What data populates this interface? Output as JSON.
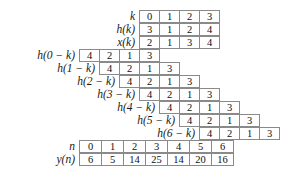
{
  "figure": {
    "cell_width_px": 21,
    "row_height_px": 13,
    "grid_color": "#8a8a8a",
    "background": "#ffffff"
  },
  "chart_data": {
    "type": "table",
    "xlabel": "",
    "ylabel": "",
    "grid": true,
    "legend": "none",
    "index_labels": [
      "k",
      "h(k)",
      "x(k)"
    ],
    "k": [
      0,
      1,
      2,
      3
    ],
    "h_k": [
      3,
      1,
      2,
      4
    ],
    "x_k": [
      2,
      1,
      3,
      4
    ],
    "flipped_label_prefix": "h(",
    "flipped_rows": [
      {
        "label": "h(0 − k)",
        "offset": -3,
        "values": [
          4,
          2,
          1,
          3
        ]
      },
      {
        "label": "h(1 − k)",
        "offset": -2,
        "values": [
          4,
          2,
          1,
          3
        ]
      },
      {
        "label": "h(2 − k)",
        "offset": -1,
        "values": [
          4,
          2,
          1,
          3
        ]
      },
      {
        "label": "h(3 − k)",
        "offset": 0,
        "values": [
          4,
          2,
          1,
          3
        ]
      },
      {
        "label": "h(4 − k)",
        "offset": 1,
        "values": [
          4,
          2,
          1,
          3
        ]
      },
      {
        "label": "h(5 − k)",
        "offset": 2,
        "values": [
          4,
          2,
          1,
          3
        ]
      },
      {
        "label": "h(6 − k)",
        "offset": 3,
        "values": [
          4,
          2,
          1,
          3
        ]
      }
    ],
    "n_label": "n",
    "n": [
      0,
      1,
      2,
      3,
      4,
      5,
      6
    ],
    "y_label": "y(n)",
    "y": [
      6,
      5,
      14,
      25,
      14,
      20,
      16
    ]
  }
}
